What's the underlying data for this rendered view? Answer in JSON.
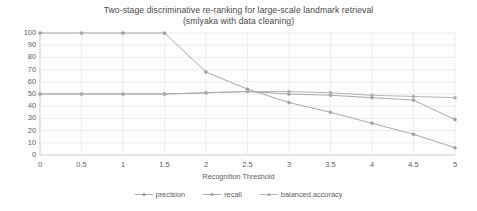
{
  "chart_data": {
    "type": "line",
    "title": "Two-stage discriminative re-ranking for large-scale landmark retrieval",
    "subtitle": "(smlyaka with data cleaning)",
    "xlabel": "Recognition Threshold",
    "ylabel": "",
    "xlim": [
      0,
      5
    ],
    "ylim": [
      0,
      100
    ],
    "xticks": [
      0,
      0.5,
      1,
      1.5,
      2,
      2.5,
      3,
      3.5,
      4,
      4.5,
      5
    ],
    "xtick_labels": [
      "0",
      "0.5",
      "1",
      "1.5",
      "2",
      "2.5",
      "3",
      "3.5",
      "4",
      "4.5",
      "5"
    ],
    "yticks": [
      0,
      10,
      20,
      30,
      40,
      50,
      60,
      70,
      80,
      90,
      100
    ],
    "ytick_labels": [
      "0",
      "10",
      "20",
      "30",
      "40",
      "50",
      "60",
      "70",
      "80",
      "90",
      "100"
    ],
    "grid": true,
    "grid_axis": "both",
    "legend_position": "bottom",
    "x": [
      0,
      0.5,
      1,
      1.5,
      2,
      2.5,
      3,
      3.5,
      4,
      4.5,
      5
    ],
    "series": [
      {
        "name": "precision",
        "color": "#9aa0a6",
        "marker": "circle",
        "values": [
          50,
          50,
          50,
          50,
          51,
          52,
          50,
          49,
          47,
          45,
          29
        ]
      },
      {
        "name": "recall",
        "color": "#9aa0a6",
        "marker": "circle",
        "values": [
          100,
          100,
          100,
          100,
          68,
          54,
          43,
          35,
          26,
          17,
          6
        ]
      },
      {
        "name": "balanced accuracy",
        "color": "#a8adb2",
        "marker": "circle",
        "values": [
          50,
          50,
          50,
          50,
          51,
          52,
          52,
          51,
          49,
          48,
          47
        ]
      }
    ]
  },
  "legend": {
    "items": [
      {
        "label": "precision"
      },
      {
        "label": "recall"
      },
      {
        "label": "balanced accuracy"
      }
    ]
  },
  "colors": {
    "grid": "#e6e6e6",
    "axis": "#d0d0d0",
    "text": "#5d5d5d",
    "background": "#fdfdfd"
  }
}
